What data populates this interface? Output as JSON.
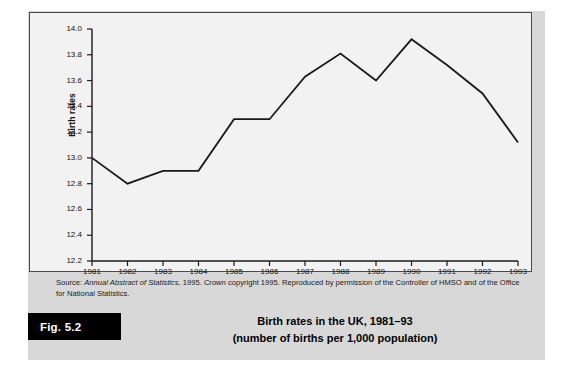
{
  "figure": {
    "badge_label": "Fig. 5.2",
    "caption_line1": "Birth rates in the UK, 1981–93",
    "caption_line2": "(number of births per 1,000 population)",
    "source_prefix": "Source: ",
    "source_italic": "Annual Abstract of Statistics",
    "source_rest": ", 1995. Crown copyright 1995. Reproduced by permission of the Controller of HMSO and of the Office for National Statistics."
  },
  "colors": {
    "panel_background": "#d8d8d8",
    "chart_background": "#f2f2f2",
    "chart_border": "#4a4a4a",
    "line_color": "#1a1a1a",
    "badge_background": "#000000",
    "badge_text": "#ffffff",
    "text": "#111111"
  },
  "chart_data": {
    "type": "line",
    "title": "Birth rates in the UK, 1981–93",
    "xlabel": "",
    "ylabel": "Birth rates",
    "categories": [
      "1981",
      "1982",
      "1983",
      "1984",
      "1985",
      "1986",
      "1987",
      "1988",
      "1989",
      "1990",
      "1991",
      "1992",
      "1993"
    ],
    "values": [
      13.0,
      12.8,
      12.9,
      12.9,
      13.3,
      13.3,
      13.63,
      13.81,
      13.6,
      13.92,
      13.72,
      13.5,
      13.12
    ],
    "ylim": [
      12.2,
      14.0
    ],
    "ytick_step": 0.2,
    "yticks": [
      "12.2",
      "12.4",
      "12.6",
      "12.8",
      "13.0",
      "13.2",
      "13.4",
      "13.6",
      "13.8",
      "14.0"
    ],
    "grid": false,
    "legend": "none",
    "series": [
      {
        "name": "Birth rate per 1,000 population",
        "values": [
          13.0,
          12.8,
          12.9,
          12.9,
          13.3,
          13.3,
          13.63,
          13.81,
          13.6,
          13.92,
          13.72,
          13.5,
          13.12
        ]
      }
    ]
  }
}
